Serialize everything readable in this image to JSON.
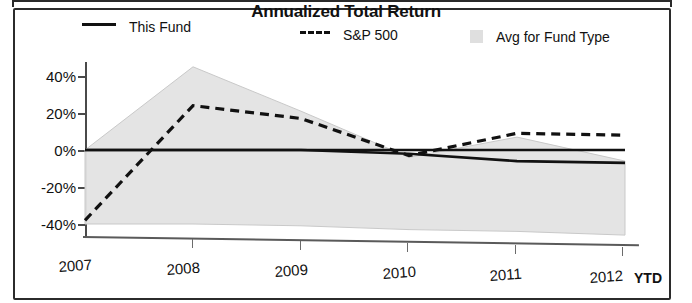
{
  "chart_data": {
    "type": "area",
    "title": "Annualized Total Return",
    "xlabel": "",
    "ylabel": "",
    "grid": false,
    "legend_position": "top",
    "categories": [
      "2007",
      "2008",
      "2009",
      "2010",
      "2011",
      "2012"
    ],
    "x_tick_labels": [
      "2007",
      "2008",
      "2009",
      "2010",
      "2011",
      "2012"
    ],
    "x_axis_suffix": "YTD",
    "y_tick_labels": [
      "40%",
      "20%",
      "0%",
      "-20%",
      "-40%"
    ],
    "y_tick_values": [
      40,
      20,
      0,
      -20,
      -40
    ],
    "ylim": [
      -46,
      48
    ],
    "series": [
      {
        "name": "This Fund",
        "style": "solid",
        "color": "#111111",
        "values": [
          0,
          0,
          0,
          -2,
          -6,
          -7
        ]
      },
      {
        "name": "S&P 500",
        "style": "dashed",
        "color": "#111111",
        "values": [
          -38,
          24,
          17,
          -3,
          9,
          8
        ]
      },
      {
        "name": "Avg for Fund Type",
        "style": "shaded-band",
        "color": "#dfdfdf",
        "upper_values": [
          0,
          45,
          21,
          -4,
          7,
          -6
        ],
        "lower_values": [
          -40,
          -40,
          -41,
          -43,
          -44,
          -46
        ]
      }
    ]
  },
  "legend": {
    "items": [
      {
        "label": "This Fund",
        "marker": "solid-line-swatch"
      },
      {
        "label": "S&P 500",
        "marker": "dashed-line-swatch"
      },
      {
        "label": "Avg for Fund Type",
        "marker": "gray-square-swatch"
      }
    ]
  },
  "axes": {
    "y_labels": [
      "40%",
      "20%",
      "0%",
      "-20%",
      "-40%"
    ],
    "x_labels": [
      "2007",
      "2008",
      "2009",
      "2010",
      "2011",
      "2012"
    ],
    "ytd": "YTD"
  },
  "colors": {
    "band_fill": "#e3e3e3",
    "line": "#111111",
    "axis": "#4a4a4a",
    "frame": "#2b2b2b"
  }
}
